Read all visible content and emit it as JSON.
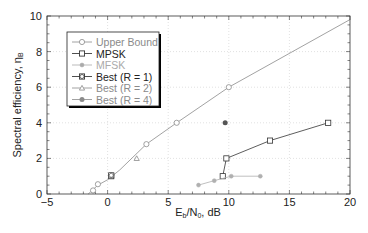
{
  "chart_data": {
    "type": "line",
    "title": "",
    "xlabel": "Eb/N0, dB",
    "xlabel_main": "E",
    "xlabel_sub1": "b",
    "xlabel_mid": "/N",
    "xlabel_sub2": "0",
    "xlabel_tail": ", dB",
    "ylabel": "Spectral efficiency, ηB",
    "ylabel_main": "Spectral efficiency, η",
    "ylabel_sub": "B",
    "xlim": [
      -5,
      20
    ],
    "ylim": [
      0,
      10
    ],
    "xticks": [
      -5,
      0,
      5,
      10,
      15,
      20
    ],
    "yticks": [
      0,
      2,
      4,
      6,
      8,
      10
    ],
    "grid": true,
    "legend_position": "upper-left",
    "series": [
      {
        "name": "Upper Bound",
        "color": "#8a8a8a",
        "marker": "circle",
        "line": true,
        "x": [
          -1.6,
          -1.2,
          -0.8,
          0.0,
          1.0,
          3.2,
          5.7,
          10.0,
          20.0
        ],
        "y": [
          0.0,
          0.25,
          0.5,
          0.8,
          1.35,
          2.8,
          4.0,
          6.0,
          9.8
        ],
        "marker_x": [
          -1.2,
          -0.8,
          0.3,
          3.2,
          5.7,
          10.0
        ],
        "marker_y": [
          0.2,
          0.55,
          1.05,
          2.8,
          4.0,
          6.0
        ]
      },
      {
        "name": "MPSK",
        "color": "#333333",
        "marker": "square",
        "line": true,
        "x": [
          0.3,
          9.5,
          9.8,
          13.4,
          18.2
        ],
        "y": [
          1.0,
          1.0,
          2.0,
          3.0,
          4.0
        ],
        "segments": [
          [
            9.5,
            9.8,
            13.4,
            18.2
          ],
          [
            1.0,
            2.0,
            3.0,
            4.0
          ]
        ]
      },
      {
        "name": "MFSK",
        "color": "#b0b0b0",
        "marker": "diamond",
        "line": true,
        "x": [
          7.5,
          8.8,
          10.2,
          12.6
        ],
        "y": [
          0.5,
          0.75,
          1.0,
          1.0
        ]
      },
      {
        "name": "Best (R = 1)",
        "color": "#444444",
        "marker": "circle-cross",
        "line": false,
        "x": [],
        "y": []
      },
      {
        "name": "Best (R = 2)",
        "color": "#8a8a8a",
        "marker": "triangle",
        "line": false,
        "x": [
          2.4
        ],
        "y": [
          2.0
        ]
      },
      {
        "name": "Best (R = 4)",
        "color": "#555555",
        "marker": "filled-circle",
        "line": false,
        "x": [
          9.7
        ],
        "y": [
          4.0
        ]
      }
    ]
  },
  "legend": {
    "items": [
      {
        "label": "Upper Bound",
        "color": "#8a8a8a"
      },
      {
        "label": "MPSK",
        "color": "#222222"
      },
      {
        "label": "MFSK",
        "color": "#aaaaaa"
      },
      {
        "label": "Best (R = 1)",
        "color": "#222222"
      },
      {
        "label": "Best (R = 2)",
        "color": "#8a8a8a"
      },
      {
        "label": "Best (R = 4)",
        "color": "#8a8a8a"
      }
    ]
  }
}
